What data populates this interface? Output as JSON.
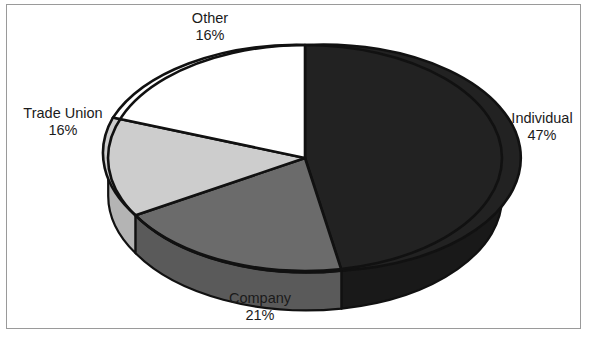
{
  "image": {
    "width": 591,
    "height": 344,
    "background": "#ffffff",
    "frame_color": "#9a9a9a"
  },
  "clipped_caption": "                                        ",
  "chart_data": {
    "type": "pie",
    "title": "",
    "subtitle": "",
    "xlabel": "",
    "ylabel": "",
    "style": "3d-exploded-none",
    "legend_position": "none",
    "grid": false,
    "labels_show_percent": true,
    "categories": [
      "Individual",
      "Company",
      "Trade Union",
      "Other"
    ],
    "values": [
      47,
      21,
      16,
      16
    ],
    "value_unit": "%",
    "slices": [
      {
        "name": "Individual",
        "label": "Individual",
        "value": 47,
        "percent_text": "47%",
        "color": "#222222",
        "side_color": "#191919",
        "label_position": "right",
        "start_angle_deg": 0,
        "end_angle_deg": 169.2
      },
      {
        "name": "Company",
        "label": "Company",
        "value": 21,
        "percent_text": "21%",
        "color": "#6b6b6b",
        "side_color": "#5a5a5a",
        "label_position": "bottom",
        "start_angle_deg": 169.2,
        "end_angle_deg": 244.8
      },
      {
        "name": "Trade Union",
        "label": "Trade Union",
        "value": 16,
        "percent_text": "16%",
        "color": "#cdcdcd",
        "side_color": "#b4b4b4",
        "label_position": "left",
        "start_angle_deg": 244.8,
        "end_angle_deg": 302.4
      },
      {
        "name": "Other",
        "label": "Other",
        "value": 16,
        "percent_text": "16%",
        "color": "#ffffff",
        "side_color": "#e6e6e6",
        "label_position": "top",
        "start_angle_deg": 302.4,
        "end_angle_deg": 360
      }
    ],
    "geometry": {
      "center_x": 305,
      "center_y": 158,
      "radius_x": 197,
      "radius_y": 113,
      "depth": 38,
      "outline_color": "#111111",
      "outline_width": 2.6
    }
  }
}
